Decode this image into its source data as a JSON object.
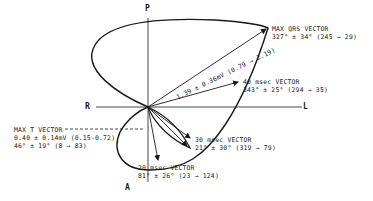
{
  "axes": {
    "top": "P",
    "bottom": "A",
    "left": "R",
    "right": "L"
  },
  "magnitude_label": "1.39 ± 0.36mV (0.79 → 2.19)",
  "vectors": {
    "max_qrs": {
      "title": "MAX QRS VECTOR",
      "value": "327° ± 34° (245 → 29)"
    },
    "v40": {
      "title": "40 msec VECTOR",
      "value": "343° ± 25° (294 → 35)"
    },
    "v30": {
      "title": "30 msec VECTOR",
      "value": "21° ± 30° (319 → 79)"
    },
    "v20": {
      "title": "20 msec VECTOR",
      "value": "81° ± 26° (23 → 124)"
    },
    "max_t": {
      "title": "MAX T VECTOR",
      "magnitude": "0.40 ± 0.14mV (0.15-0.72)",
      "value": "46° ± 19° (8 → 83)"
    }
  },
  "colors": {
    "ink": "#1a1a1a",
    "background": "#ffffff"
  }
}
